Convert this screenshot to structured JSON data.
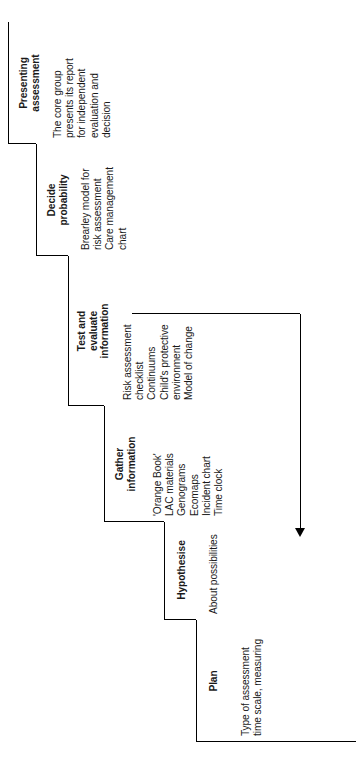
{
  "diagram": {
    "type": "staircase-flowchart",
    "orientation": "rotated-90-counterclockwise",
    "line_color": "#000000",
    "text_color": "#1a1a1a",
    "background": "#ffffff",
    "steps": [
      {
        "id": "plan",
        "heading": "Plan",
        "body": "Type of assessment\ntime scale, measuring"
      },
      {
        "id": "hypothesise",
        "heading": "Hypothesise",
        "body": "About possibilities"
      },
      {
        "id": "gather-information",
        "heading": "Gather\ninformation",
        "body": "'Orange Book'\nLAC materials\nGenograms\nEcomaps\nIncident chart\nTime clock"
      },
      {
        "id": "test-and-evaluate-information",
        "heading": "Test and\nevaluate\ninformation",
        "body": "Risk assessment\nchecklist\nContinuums\nChild's protective\nenvironment\nModel of change"
      },
      {
        "id": "decide-probability",
        "heading": "Decide\nprobability",
        "body": "Brearley model for\nrisk assessment\nCare management\nchart"
      },
      {
        "id": "presenting-assessment",
        "heading": "Presenting\nassessment",
        "body": "The core group\npresents its report\nfor independent\nevaluation and\ndecision"
      }
    ],
    "feedback_arrow": {
      "label": "",
      "from_step": "presenting-assessment",
      "to_step": "hypothesise"
    }
  }
}
